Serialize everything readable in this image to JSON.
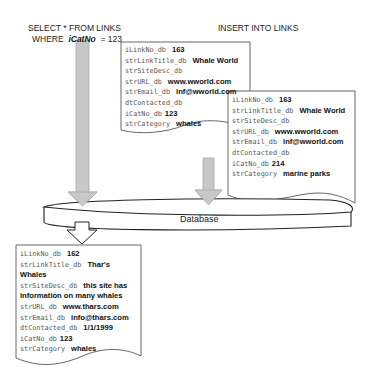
{
  "select_query": {
    "line1": "SELECT * FROM LINKS",
    "line2_prefix": "WHERE",
    "line2_field": "iCatNo",
    "line2_suffix": "= 123"
  },
  "insert_query": {
    "label": "INSERT INTO LINKS"
  },
  "database": {
    "label": "Database"
  },
  "record_existing": {
    "fields": [
      {
        "name": "iLinkNo_db",
        "value": "163"
      },
      {
        "name": "strLinkTitle_db",
        "value": "Whale World"
      },
      {
        "name": "strSiteDesc_db",
        "value": ""
      },
      {
        "name": "strURL_db",
        "value": "www.wworld.com"
      },
      {
        "name": "strEmail_db",
        "value": "inf@wworld.com"
      },
      {
        "name": "dtContacted_db",
        "value": ""
      },
      {
        "name": "iCatNo_db",
        "value": "123"
      },
      {
        "name": "strCategory",
        "value": "whales"
      }
    ]
  },
  "record_inserted": {
    "fields": [
      {
        "name": "iLinkNo_db",
        "value": "163"
      },
      {
        "name": "strLinkTitle_db",
        "value": "Whale World"
      },
      {
        "name": "strSiteDesc_db",
        "value": ""
      },
      {
        "name": "strURL_db",
        "value": "www.wworld.com"
      },
      {
        "name": "strEmail_db",
        "value": "inf@wworld.com"
      },
      {
        "name": "dtContacted_db",
        "value": ""
      },
      {
        "name": "iCatNo_db",
        "value": "214"
      },
      {
        "name": "strCategory",
        "value": "marine parks"
      }
    ]
  },
  "record_result": {
    "fields": [
      {
        "name": "iLinkNo_db",
        "value": "162"
      },
      {
        "name": "strLinkTitle_db",
        "value": "Thar's Whales"
      },
      {
        "name": "strSiteDesc_db",
        "value": "this site has information on many whales"
      },
      {
        "name": "strURL_db",
        "value": "www.thars.com"
      },
      {
        "name": "strEmail_db",
        "value": "info@thars.com"
      },
      {
        "name": "dtContacted_db",
        "value": "1/1/1999"
      },
      {
        "name": "iCatNo_db",
        "value": "123"
      },
      {
        "name": "strCategory",
        "value": "whales"
      }
    ]
  },
  "colors": {
    "arrow_fill": "#c8c8c8",
    "arrow_stroke": "#9a9a9a",
    "outline": "#333333"
  }
}
